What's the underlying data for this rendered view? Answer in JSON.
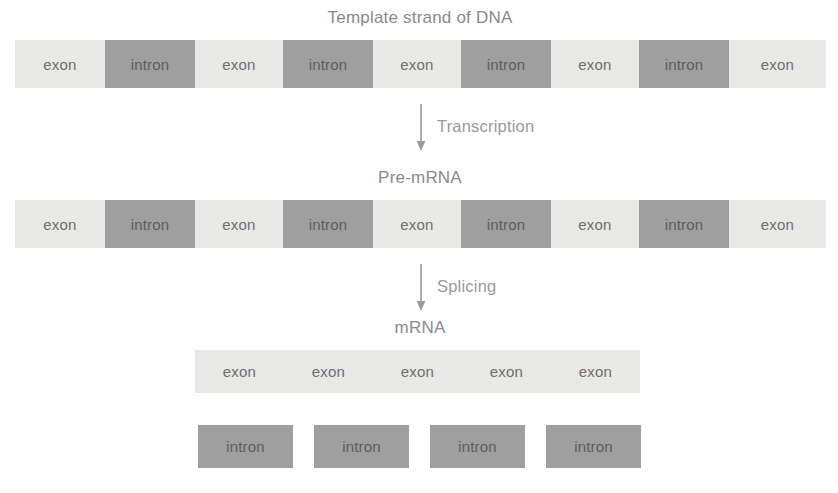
{
  "title": "Template strand of DNA",
  "labels": {
    "pre_mrna": "Pre-mRNA",
    "mrna": "mRNA"
  },
  "steps": {
    "transcription": "Transcription",
    "splicing": "Splicing"
  },
  "segment_names": {
    "exon": "exon",
    "intron": "intron"
  },
  "colors": {
    "exon": "#e9e9e7",
    "intron": "#a0a0a0",
    "text": "#6f6f6f",
    "caption": "#8b8b8b",
    "arrow": "#9a9a9a",
    "background": "#ffffff"
  },
  "dna_strand": {
    "segments": [
      {
        "type": "exon",
        "label": "exon"
      },
      {
        "type": "intron",
        "label": "intron"
      },
      {
        "type": "exon",
        "label": "exon"
      },
      {
        "type": "intron",
        "label": "intron"
      },
      {
        "type": "exon",
        "label": "exon"
      },
      {
        "type": "intron",
        "label": "intron"
      },
      {
        "type": "exon",
        "label": "exon"
      },
      {
        "type": "intron",
        "label": "intron"
      },
      {
        "type": "exon",
        "label": "exon"
      }
    ]
  },
  "pre_mrna_strand": {
    "segments": [
      {
        "type": "exon",
        "label": "exon"
      },
      {
        "type": "intron",
        "label": "intron"
      },
      {
        "type": "exon",
        "label": "exon"
      },
      {
        "type": "intron",
        "label": "intron"
      },
      {
        "type": "exon",
        "label": "exon"
      },
      {
        "type": "intron",
        "label": "intron"
      },
      {
        "type": "exon",
        "label": "exon"
      },
      {
        "type": "intron",
        "label": "intron"
      },
      {
        "type": "exon",
        "label": "exon"
      }
    ]
  },
  "mrna_strand": {
    "segments": [
      {
        "type": "exon",
        "label": "exon"
      },
      {
        "type": "exon",
        "label": "exon"
      },
      {
        "type": "exon",
        "label": "exon"
      },
      {
        "type": "exon",
        "label": "exon"
      },
      {
        "type": "exon",
        "label": "exon"
      }
    ]
  },
  "excised_introns": {
    "segments": [
      {
        "type": "intron",
        "label": "intron"
      },
      {
        "type": "intron",
        "label": "intron"
      },
      {
        "type": "intron",
        "label": "intron"
      },
      {
        "type": "intron",
        "label": "intron"
      }
    ]
  }
}
